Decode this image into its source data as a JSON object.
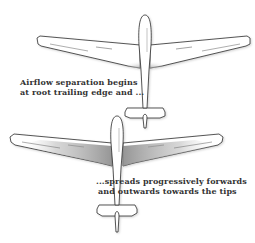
{
  "diagram": {
    "colors": {
      "outline": "#2b2b2b",
      "fill": "#ffffff",
      "shading": "#9a9a9a",
      "text": "#333333"
    },
    "panels": [
      {
        "id": "stage-1",
        "caption_lines": [
          "Airflow separation begins",
          "at root trailing edge and ..."
        ]
      },
      {
        "id": "stage-2",
        "caption_lines": [
          "...spreads progressively forwards",
          "and outwards towards the tips"
        ]
      }
    ]
  }
}
